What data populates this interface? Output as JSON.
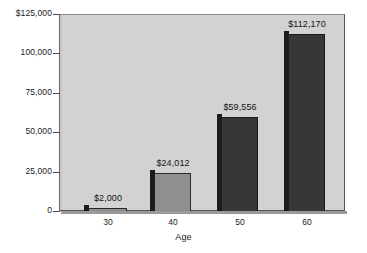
{
  "chart_data": {
    "type": "bar",
    "title": "",
    "xlabel": "Age",
    "ylabel": "",
    "categories": [
      "30",
      "40",
      "50",
      "60"
    ],
    "values": [
      2000,
      24012,
      59556,
      112170
    ],
    "value_labels": [
      "$2,000",
      "$24,012",
      "$59,556",
      "$112,170"
    ],
    "ylim": [
      0,
      125000
    ],
    "y_ticks": [
      0,
      25000,
      50000,
      75000,
      100000,
      125000
    ],
    "y_tick_labels": [
      "0",
      "25,000",
      "50,000",
      "75,000",
      "100,000",
      "$125,000"
    ],
    "grid": false,
    "legend": null,
    "bar_colors": [
      "#8f8f8f",
      "#8f8f8f",
      "#373737",
      "#373737"
    ],
    "plot_background": "#d2d2d2",
    "page_background": "#ffffff"
  },
  "axes": {
    "y": {
      "ticks": [
        {
          "label": "$125,000",
          "value": 125000
        },
        {
          "label": "100,000",
          "value": 100000
        },
        {
          "label": "75,000",
          "value": 75000
        },
        {
          "label": "50,000",
          "value": 50000
        },
        {
          "label": "25,000",
          "value": 25000
        },
        {
          "label": "0",
          "value": 0
        }
      ]
    },
    "x": {
      "title": "Age",
      "ticks": [
        {
          "label": "30"
        },
        {
          "label": "40"
        },
        {
          "label": "50"
        },
        {
          "label": "60"
        }
      ]
    }
  },
  "bars": [
    {
      "category": "30",
      "value": 2000,
      "label": "$2,000",
      "tone": "light"
    },
    {
      "category": "40",
      "value": 24012,
      "label": "$24,012",
      "tone": "light"
    },
    {
      "category": "50",
      "value": 59556,
      "label": "$59,556",
      "tone": "dark"
    },
    {
      "category": "60",
      "value": 112170,
      "label": "$112,170",
      "tone": "dark"
    }
  ]
}
